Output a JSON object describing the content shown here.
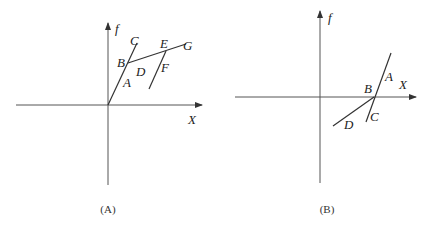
{
  "panels": [
    {
      "id": "A",
      "caption": "(A)",
      "y_axis_label": "f",
      "x_axis_label": "X",
      "point_labels": {
        "A": "A",
        "B": "B",
        "C": "C",
        "D": "D",
        "E": "E",
        "F": "F",
        "G": "G"
      }
    },
    {
      "id": "B",
      "caption": "(B)",
      "y_axis_label": "f",
      "x_axis_label": "X",
      "point_labels": {
        "A": "A",
        "B": "B",
        "C": "C",
        "D": "D"
      }
    }
  ],
  "colors": {
    "line": "#333333",
    "axis": "#555555",
    "background": "#ffffff"
  }
}
